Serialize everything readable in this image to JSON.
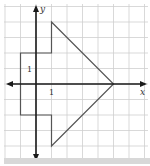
{
  "figure": {
    "type": "coordinate-grid-figure",
    "axes": {
      "x_label": "x",
      "y_label": "y",
      "x_tick_label": "1",
      "y_tick_label": "1"
    },
    "grid": {
      "unit_px": 15.5,
      "origin_px": [
        36,
        84
      ],
      "x_range": [
        -2,
        7
      ],
      "y_range": [
        -5,
        5
      ]
    },
    "shape": {
      "name": "arrow-polygon",
      "vertices": [
        [
          1,
          4
        ],
        [
          5,
          0
        ],
        [
          1,
          -4
        ],
        [
          1,
          -2
        ],
        [
          -1,
          -2
        ],
        [
          -1,
          2
        ],
        [
          1,
          2
        ]
      ],
      "stroke": "#555555"
    },
    "colors": {
      "grid": "#cfcfcf",
      "axis": "#1a1a1a",
      "shape": "#555555"
    }
  }
}
